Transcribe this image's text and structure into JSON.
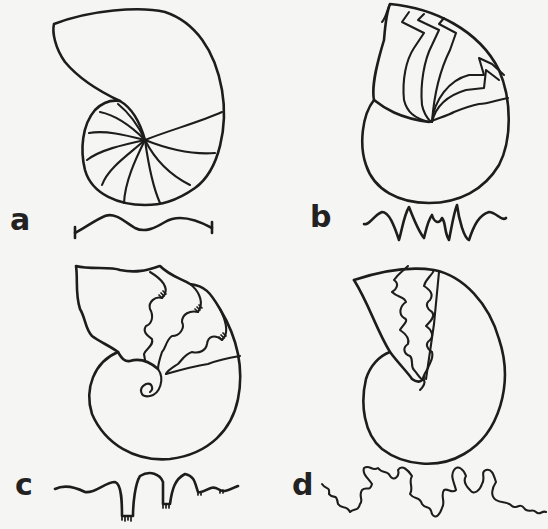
{
  "figure": {
    "panels": [
      {
        "id": "a",
        "label": "a",
        "description": "Nautiloid shell with simple curved septa; suture line is a gentle wave"
      },
      {
        "id": "b",
        "label": "b",
        "description": "Goniatite shell with angular zig-zag septa; suture with pointed lobes"
      },
      {
        "id": "c",
        "label": "c",
        "description": "Ceratite shell with serrated lobes; suture with frilled lobe bases"
      },
      {
        "id": "d",
        "label": "d",
        "description": "Ammonite shell with highly complex frilled septa; suture intricately folded"
      }
    ]
  },
  "colors": {
    "background": "#f5f5f3",
    "ink": "#1d1d1d"
  }
}
